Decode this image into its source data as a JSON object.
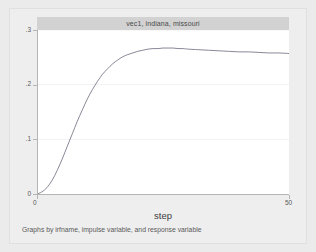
{
  "figure": {
    "background_color": "#ebebeb",
    "canvas_color": "#eeeeee",
    "plot_background_color": "#ffffff",
    "title_band_color": "#d2d2d2"
  },
  "chart_data": {
    "type": "line",
    "title": "vec1, indiana, missouri",
    "xlabel": "step",
    "ylabel": "",
    "note": "Graphs by irfname, impulse variable, and response variable",
    "xlim": [
      0,
      50
    ],
    "ylim": [
      0,
      0.3
    ],
    "xticks": [
      0,
      50
    ],
    "xtick_labels": [
      "0",
      "50"
    ],
    "yticks": [
      0,
      0.1,
      0.2,
      0.3
    ],
    "ytick_labels": [
      "0",
      ".1",
      ".2",
      ".3"
    ],
    "grid": true,
    "grid_axis": "y",
    "legend": false,
    "line_color": "#7a7a8c",
    "series": [
      {
        "name": "irf",
        "x": [
          0,
          1,
          2,
          3,
          4,
          5,
          6,
          7,
          8,
          9,
          10,
          11,
          12,
          13,
          14,
          15,
          16,
          17,
          18,
          19,
          20,
          21,
          22,
          23,
          24,
          25,
          26,
          27,
          28,
          29,
          30,
          32,
          34,
          36,
          38,
          40,
          42,
          44,
          46,
          48,
          50
        ],
        "values": [
          0.0,
          0.004,
          0.012,
          0.025,
          0.043,
          0.064,
          0.087,
          0.11,
          0.133,
          0.154,
          0.174,
          0.191,
          0.206,
          0.219,
          0.229,
          0.238,
          0.245,
          0.251,
          0.255,
          0.258,
          0.261,
          0.263,
          0.265,
          0.266,
          0.266,
          0.267,
          0.267,
          0.267,
          0.266,
          0.266,
          0.265,
          0.264,
          0.263,
          0.262,
          0.261,
          0.26,
          0.26,
          0.259,
          0.258,
          0.258,
          0.257
        ]
      }
    ]
  }
}
